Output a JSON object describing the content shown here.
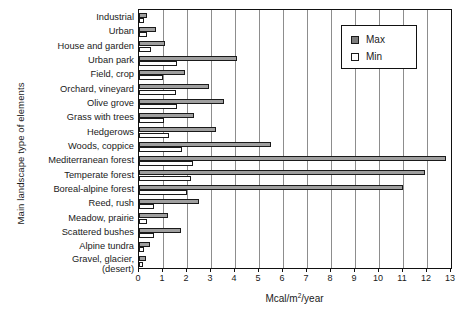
{
  "chart_data": {
    "type": "bar",
    "orientation": "horizontal",
    "title": "",
    "xlabel": "Mcal/m2/year",
    "xlabel_display": "Mcal/m²/year",
    "ylabel": "Main landscape type of elements",
    "xlim": [
      0,
      13
    ],
    "xticks": [
      0,
      1,
      2,
      3,
      4,
      5,
      6,
      7,
      8,
      9,
      10,
      11,
      12,
      13
    ],
    "xtick_labels": [
      "0",
      "1",
      "2",
      "3",
      "4",
      "5",
      "6",
      "7",
      "8",
      "9",
      "10",
      "11",
      "12",
      "13"
    ],
    "grid": "vertical",
    "legend_position": "top-right",
    "categories": [
      "Industrial",
      "Urban",
      "House and garden",
      "Urban park",
      "Field, crop",
      "Orchard, vineyard",
      "Olive grove",
      "Grass with trees",
      "Hedgerows",
      "Woods, coppice",
      "Mediterranean forest",
      "Temperate forest",
      "Boreal-alpine forest",
      "Reed, rush",
      "Meadow, prairie",
      "Scattered bushes",
      "Alpine tundra",
      "Gravel, glacier, (desert)"
    ],
    "category_lines": [
      [
        "Industrial"
      ],
      [
        "Urban"
      ],
      [
        "House and garden"
      ],
      [
        "Urban park"
      ],
      [
        "Field, crop"
      ],
      [
        "Orchard, vineyard"
      ],
      [
        "Olive grove"
      ],
      [
        "Grass with trees"
      ],
      [
        "Hedgerows"
      ],
      [
        "Woods, coppice"
      ],
      [
        "Mediterranean forest"
      ],
      [
        "Temperate forest"
      ],
      [
        "Boreal-alpine forest"
      ],
      [
        "Reed, rush"
      ],
      [
        "Meadow, prairie"
      ],
      [
        "Scattered bushes"
      ],
      [
        "Alpine tundra"
      ],
      [
        "Gravel, glacier,",
        "(desert)"
      ]
    ],
    "series": [
      {
        "name": "Max",
        "color": "#9f9f9f",
        "values": [
          0.35,
          0.7,
          1.1,
          4.1,
          1.9,
          2.9,
          3.55,
          2.3,
          3.2,
          5.5,
          12.8,
          11.9,
          11.0,
          2.5,
          1.2,
          1.75,
          0.46,
          0.3
        ]
      },
      {
        "name": "Min",
        "color": "#ffffff",
        "values": [
          0.2,
          0.33,
          0.5,
          1.6,
          1.0,
          1.55,
          1.6,
          1.05,
          1.25,
          1.8,
          2.25,
          2.15,
          2.0,
          0.62,
          0.33,
          0.62,
          0.2,
          0.15
        ]
      }
    ]
  },
  "legend": {
    "items": [
      {
        "label": "Max",
        "swatch": "max-swatch"
      },
      {
        "label": "Min",
        "swatch": "min-swatch"
      }
    ]
  }
}
